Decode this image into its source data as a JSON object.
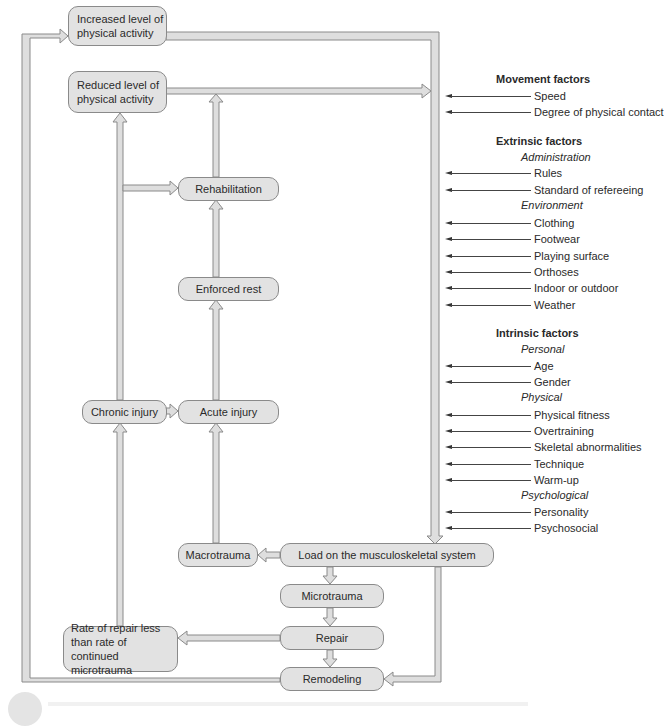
{
  "diagram": {
    "boxes": {
      "increased": "Increased level of\nphysical activity",
      "reduced": "Reduced level of\nphysical activity",
      "rehabilitation": "Rehabilitation",
      "enforced_rest": "Enforced rest",
      "chronic_injury": "Chronic injury",
      "acute_injury": "Acute injury",
      "macrotrauma": "Macrotrauma",
      "load": "Load on the musculoskeletal system",
      "microtrauma": "Microtrauma",
      "repair": "Repair",
      "rate_of_repair": "Rate of repair less\nthan rate of continued\nmicrotrauma",
      "remodeling": "Remodeling"
    },
    "factors": {
      "movement": {
        "heading": "Movement factors",
        "items": [
          "Speed",
          "Degree of physical contact"
        ]
      },
      "extrinsic": {
        "heading": "Extrinsic factors",
        "groups": [
          {
            "label": "Administration",
            "items": [
              "Rules",
              "Standard of refereeing"
            ]
          },
          {
            "label": "Environment",
            "items": [
              "Clothing",
              "Footwear",
              "Playing surface",
              "Orthoses",
              "Indoor or outdoor",
              "Weather"
            ]
          }
        ]
      },
      "intrinsic": {
        "heading": "Intrinsic factors",
        "groups": [
          {
            "label": "Personal",
            "items": [
              "Age",
              "Gender"
            ]
          },
          {
            "label": "Physical",
            "items": [
              "Physical fitness",
              "Overtraining",
              "Skeletal abnormalities",
              "Technique",
              "Warm-up"
            ]
          },
          {
            "label": "Psychological",
            "items": [
              "Personality",
              "Psychosocial"
            ]
          }
        ]
      }
    },
    "colors": {
      "box_fill": "#e2e2e2",
      "box_border": "#8a8a8a",
      "arrow_fill": "#dedede",
      "arrow_stroke": "#8a8a8a",
      "text": "#2a2a2a"
    }
  }
}
